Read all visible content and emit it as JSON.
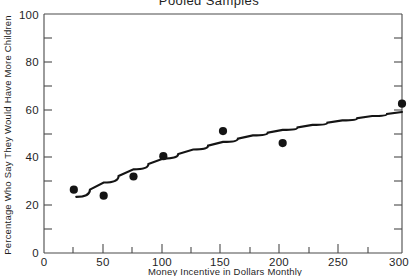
{
  "chart_data": {
    "type": "scatter",
    "title": "Pooled Samples",
    "xlabel": "Money Incentive in Dollars Monthly",
    "ylabel": "Percentage Who Say They Would Have More Children",
    "xlim": [
      0,
      300
    ],
    "ylim": [
      0,
      100
    ],
    "xticks": [
      0,
      50,
      100,
      150,
      200,
      250,
      300
    ],
    "xtick_labels": [
      "0",
      "50",
      "100",
      "150",
      "200",
      "250",
      "300"
    ],
    "yticks": [
      0,
      20,
      40,
      60,
      80,
      100
    ],
    "ytick_labels": [
      "0",
      "20",
      "40",
      "60",
      "80",
      "100"
    ],
    "x_minor_tick_interval": 25,
    "y_minor_tick_interval": 10,
    "grid": false,
    "legend": null,
    "series": [
      {
        "name": "Observed percentage",
        "type": "scatter",
        "marker": "filled-circle",
        "color": "#141414",
        "x": [
          25,
          50,
          75,
          100,
          150,
          200,
          300
        ],
        "y": [
          26.5,
          24,
          32,
          40.5,
          51,
          46,
          62.5
        ]
      },
      {
        "name": "Fitted curve",
        "type": "line",
        "color": "#141414",
        "x": [
          27,
          50,
          75,
          100,
          125,
          150,
          175,
          200,
          225,
          250,
          275,
          300
        ],
        "y": [
          23.5,
          29.5,
          35,
          39.5,
          43.3,
          46.5,
          49.2,
          51.5,
          53.6,
          55.5,
          57.3,
          59
        ]
      }
    ]
  },
  "axis_titles": {
    "x": "Money Incentive in Dollars Monthly",
    "y": "Percentage Who Say They Would Have More Children"
  }
}
